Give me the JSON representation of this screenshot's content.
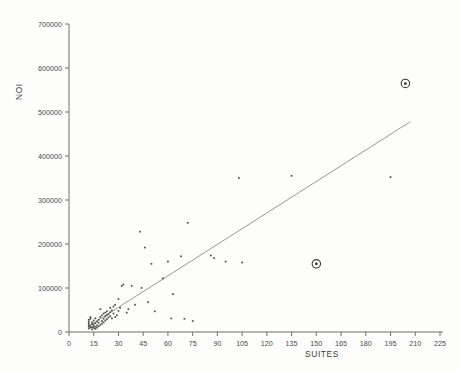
{
  "chart_data": {
    "type": "scatter",
    "title": "",
    "xlabel": "SUITES",
    "ylabel": "NOI",
    "xlim": [
      0,
      225
    ],
    "ylim": [
      0,
      700000
    ],
    "grid": false,
    "legend": "none",
    "xticks": [
      0,
      15,
      30,
      45,
      60,
      75,
      90,
      105,
      120,
      135,
      150,
      165,
      180,
      195,
      210,
      225
    ],
    "xticklabels": [
      "0",
      "15",
      "30",
      "45",
      "60",
      "75",
      "90",
      "105",
      "120",
      "135",
      "150",
      "165",
      "180",
      "195",
      "210",
      "225"
    ],
    "yticks": [
      0,
      100000,
      200000,
      300000,
      400000,
      500000,
      600000,
      700000
    ],
    "yticklabels": [
      "0",
      "100000",
      "200000",
      "300000",
      "400000",
      "500000",
      "600000",
      "700000"
    ],
    "series": [
      {
        "name": "observations",
        "marker": "dot",
        "points": [
          [
            12,
            8000
          ],
          [
            12,
            12000
          ],
          [
            12,
            16000
          ],
          [
            12,
            20000
          ],
          [
            12,
            24000
          ],
          [
            12,
            28000
          ],
          [
            13,
            10000
          ],
          [
            13,
            14000
          ],
          [
            13,
            30000
          ],
          [
            13,
            34000
          ],
          [
            14,
            6000
          ],
          [
            14,
            11000
          ],
          [
            14,
            18000
          ],
          [
            14,
            22000
          ],
          [
            15,
            9000
          ],
          [
            15,
            13000
          ],
          [
            15,
            17000
          ],
          [
            15,
            26000
          ],
          [
            16,
            7000
          ],
          [
            16,
            12000
          ],
          [
            16,
            20000
          ],
          [
            16,
            31000
          ],
          [
            17,
            10000
          ],
          [
            17,
            15000
          ],
          [
            17,
            24000
          ],
          [
            18,
            13000
          ],
          [
            18,
            21000
          ],
          [
            18,
            28000
          ],
          [
            19,
            16000
          ],
          [
            19,
            34000
          ],
          [
            19,
            52000
          ],
          [
            20,
            19000
          ],
          [
            20,
            25000
          ],
          [
            20,
            38000
          ],
          [
            21,
            22000
          ],
          [
            21,
            30000
          ],
          [
            21,
            42000
          ],
          [
            22,
            26000
          ],
          [
            22,
            35000
          ],
          [
            22,
            44000
          ],
          [
            23,
            29000
          ],
          [
            23,
            38000
          ],
          [
            23,
            47000
          ],
          [
            24,
            33000
          ],
          [
            24,
            41000
          ],
          [
            25,
            36000
          ],
          [
            25,
            45000
          ],
          [
            25,
            55000
          ],
          [
            26,
            31000
          ],
          [
            26,
            49000
          ],
          [
            27,
            42000
          ],
          [
            27,
            58000
          ],
          [
            28,
            34000
          ],
          [
            28,
            62000
          ],
          [
            29,
            38000
          ],
          [
            30,
            48000
          ],
          [
            30,
            75000
          ],
          [
            31,
            55000
          ],
          [
            32,
            105000
          ],
          [
            33,
            108000
          ],
          [
            35,
            44000
          ],
          [
            36,
            52000
          ],
          [
            38,
            105000
          ],
          [
            40,
            62000
          ],
          [
            43,
            228000
          ],
          [
            44,
            100000
          ],
          [
            46,
            192000
          ],
          [
            48,
            68000
          ],
          [
            50,
            155000
          ],
          [
            52,
            47000
          ],
          [
            57,
            122000
          ],
          [
            60,
            160000
          ],
          [
            62,
            31000
          ],
          [
            63,
            86000
          ],
          [
            68,
            172000
          ],
          [
            70,
            30000
          ],
          [
            72,
            248000
          ],
          [
            75,
            25000
          ],
          [
            86,
            174000
          ],
          [
            88,
            168000
          ],
          [
            95,
            160000
          ],
          [
            103,
            350000
          ],
          [
            105,
            158000
          ],
          [
            135,
            355000
          ],
          [
            195,
            352000
          ]
        ]
      },
      {
        "name": "flagged-outliers",
        "marker": "circled-dot",
        "points": [
          [
            204,
            565000
          ],
          [
            150,
            155000
          ]
        ]
      }
    ],
    "fit_line": {
      "label": "regression line",
      "x_start": 11.5,
      "y_start": 12000,
      "x_end": 207,
      "y_end": 478000
    }
  },
  "colors": {
    "background": "#fdfdfc",
    "axis": "#6e6e6e",
    "tick_label": "#4a4a4a",
    "point": "#4d4d4d",
    "fit_line": "#8c8c8c",
    "outlier_ring": "#3a3a3a"
  }
}
